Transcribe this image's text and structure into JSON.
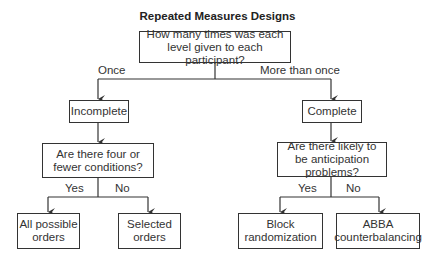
{
  "title": "Repeated Measures Designs",
  "root": {
    "text": "How many times was each level given to each participant?"
  },
  "branches": {
    "left_label": "Once",
    "right_label": "More than once"
  },
  "left": {
    "node": "Incomplete",
    "question": "Are there four or fewer conditions?",
    "yes_label": "Yes",
    "no_label": "No",
    "yes_leaf": "All possible orders",
    "no_leaf": "Selected orders"
  },
  "right": {
    "node": "Complete",
    "question": "Are there likely to be anticipation problems?",
    "yes_label": "Yes",
    "no_label": "No",
    "yes_leaf": "Block randomization",
    "no_leaf": "ABBA counterbalancing"
  },
  "colors": {
    "line": "#333333",
    "text": "#333333",
    "background": "#ffffff"
  }
}
